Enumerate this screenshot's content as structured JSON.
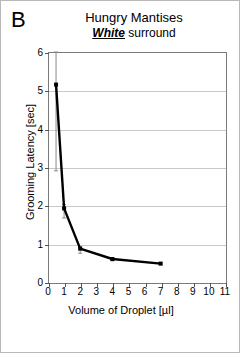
{
  "figure": {
    "panel_label": "B",
    "title_main": "Hungry Mantises",
    "title_sub_emph": "White",
    "title_sub_rest": " surround",
    "border_color": "#b8b8b8",
    "series_color": "#000000",
    "grid_color": "#c9c9c9",
    "errorbar_color": "#8a8a8a"
  },
  "chart_data": {
    "type": "line",
    "subtitle": "White surround",
    "panel": "B",
    "xlabel": "Volume of Droplet [µl]",
    "ylabel": "Grooming Latency [sec]",
    "xlim": [
      0,
      11
    ],
    "ylim": [
      0,
      6
    ],
    "xticks": [
      0,
      1,
      2,
      3,
      4,
      5,
      6,
      7,
      8,
      9,
      10,
      11
    ],
    "xtick_labels": [
      "0",
      "1",
      "2",
      "3",
      "4",
      "5",
      "6",
      "7",
      "8",
      "9",
      "10",
      "11"
    ],
    "yticks": [
      0,
      1,
      2,
      3,
      4,
      5,
      6
    ],
    "ytick_labels": [
      "0",
      "1",
      "2",
      "3",
      "4",
      "5",
      "6"
    ],
    "grid": "horizontal",
    "legend": "none",
    "marker": "square",
    "series": [
      {
        "name": "Grooming latency",
        "x": [
          0.5,
          1,
          2,
          4,
          7
        ],
        "y": [
          5.15,
          1.92,
          0.87,
          0.6,
          0.48
        ],
        "yerr_low": [
          2.25,
          0.25,
          0.12,
          0.05,
          0.03
        ],
        "yerr_high": [
          0.85,
          0.1,
          0.05,
          0.03,
          0.02
        ]
      }
    ]
  }
}
